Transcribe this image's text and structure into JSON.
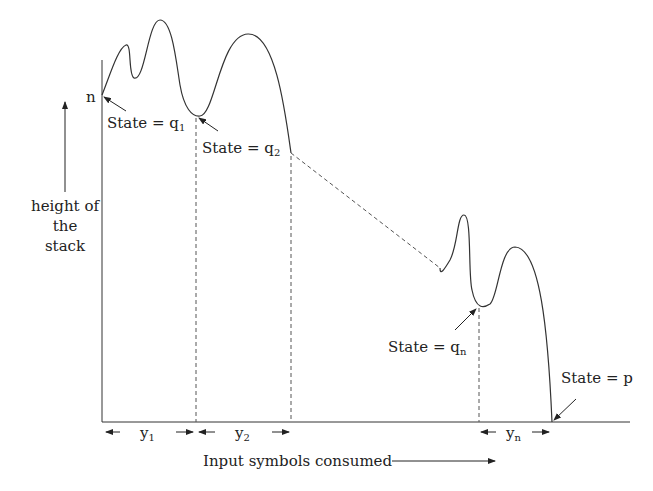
{
  "diagram": {
    "y_axis_label": [
      "height of",
      "the",
      "stack"
    ],
    "x_axis_label": "Input symbols consumed",
    "start_height_label": "n",
    "states": [
      {
        "label": "State = ",
        "var": "q",
        "sub": "1"
      },
      {
        "label": "State = ",
        "var": "q",
        "sub": "2"
      },
      {
        "label": "State = ",
        "var": "q",
        "sub": "n"
      },
      {
        "label": "State = ",
        "var": "p",
        "sub": ""
      }
    ],
    "segments": [
      {
        "var": "y",
        "sub": "1"
      },
      {
        "var": "y",
        "sub": "2"
      },
      {
        "var": "y",
        "sub": "n"
      }
    ]
  }
}
